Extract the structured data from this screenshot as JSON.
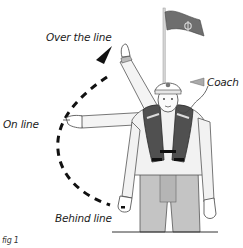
{
  "diagram": {
    "labels": {
      "over_the_line": "Over the line",
      "on_line": "On line",
      "behind_line": "Behind line",
      "coach": "Coach",
      "figure_caption": "fig 1"
    },
    "elements": {
      "flag": "flag on pole with rope-knot emblem",
      "person": "coach in cap and life jacket signalling with arm positions",
      "arc": "dashed curved arrow from behind line to over the line"
    },
    "colors": {
      "flag": "#6e6e6e",
      "jacket": "#505050",
      "trousers": "#c4c4c4",
      "outline": "#2a2a2a",
      "arrow": "#111111"
    }
  }
}
